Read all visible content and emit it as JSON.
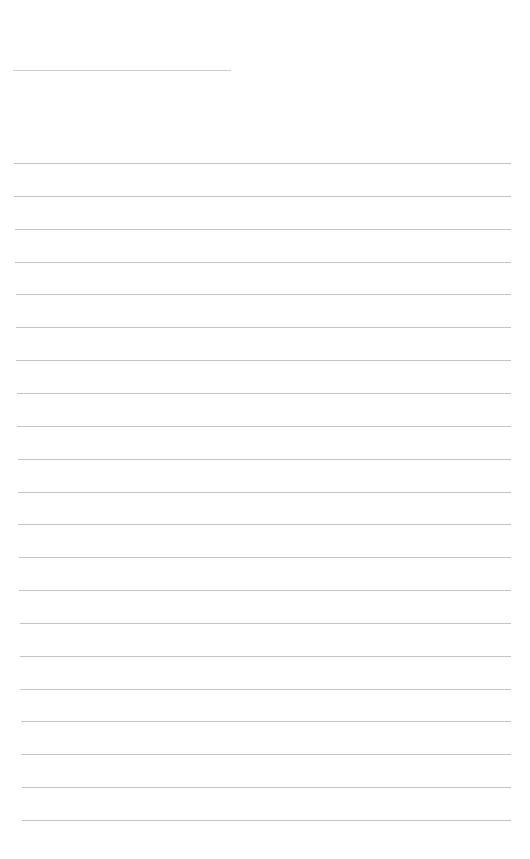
{
  "page": {
    "type": "blank-lined-sheet",
    "background_color": "#ffffff",
    "line_color": "#c4c4c4"
  },
  "header": {
    "title_field_value": ""
  },
  "lines": {
    "count": 21,
    "first_top": 163,
    "spacing": 32.85,
    "left_start": 14,
    "left_end": 22,
    "right": 511,
    "entries": [
      "",
      "",
      "",
      "",
      "",
      "",
      "",
      "",
      "",
      "",
      "",
      "",
      "",
      "",
      "",
      "",
      "",
      "",
      "",
      "",
      ""
    ]
  }
}
